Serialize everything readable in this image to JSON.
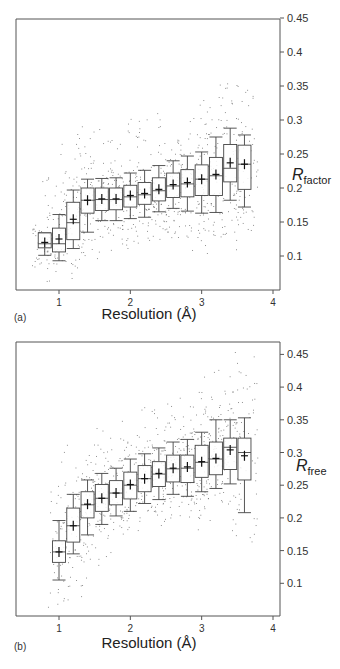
{
  "chart_data": [
    {
      "type": "box",
      "panel_label": "(a)",
      "title": "",
      "xlabel": "Resolution (Å)",
      "ylabel": "R",
      "ylabel_subscript": "factor",
      "xlim": [
        0.4,
        4.1
      ],
      "ylim": [
        0.05,
        0.455
      ],
      "xticks": [
        1,
        2,
        3,
        4
      ],
      "yticks": [
        0.1,
        0.15,
        0.2,
        0.25,
        0.3,
        0.35,
        0.4,
        0.45
      ],
      "ytick_labels": [
        "0.1",
        "0.15",
        "0.2",
        "0.25",
        "0.3",
        "0.35",
        "0.4",
        "0.45"
      ],
      "y_axis_position": "right",
      "grid": false,
      "boxes": [
        {
          "x": 0.8,
          "whisker_low": 0.101,
          "q1": 0.112,
          "median": 0.118,
          "q3": 0.134,
          "whisker_high": 0.134,
          "mean": 0.12
        },
        {
          "x": 1.0,
          "whisker_low": 0.093,
          "q1": 0.106,
          "median": 0.118,
          "q3": 0.141,
          "whisker_high": 0.161,
          "mean": 0.125
        },
        {
          "x": 1.2,
          "whisker_low": 0.111,
          "q1": 0.124,
          "median": 0.149,
          "q3": 0.179,
          "whisker_high": 0.197,
          "mean": 0.154
        },
        {
          "x": 1.4,
          "whisker_low": 0.135,
          "q1": 0.163,
          "median": 0.182,
          "q3": 0.2,
          "whisker_high": 0.213,
          "mean": 0.182
        },
        {
          "x": 1.6,
          "whisker_low": 0.152,
          "q1": 0.167,
          "median": 0.183,
          "q3": 0.2,
          "whisker_high": 0.214,
          "mean": 0.184
        },
        {
          "x": 1.8,
          "whisker_low": 0.152,
          "q1": 0.168,
          "median": 0.183,
          "q3": 0.2,
          "whisker_high": 0.215,
          "mean": 0.184
        },
        {
          "x": 2.0,
          "whisker_low": 0.155,
          "q1": 0.172,
          "median": 0.187,
          "q3": 0.204,
          "whisker_high": 0.222,
          "mean": 0.189
        },
        {
          "x": 2.2,
          "whisker_low": 0.157,
          "q1": 0.176,
          "median": 0.19,
          "q3": 0.208,
          "whisker_high": 0.226,
          "mean": 0.192
        },
        {
          "x": 2.4,
          "whisker_low": 0.165,
          "q1": 0.181,
          "median": 0.196,
          "q3": 0.215,
          "whisker_high": 0.233,
          "mean": 0.198
        },
        {
          "x": 2.6,
          "whisker_low": 0.17,
          "q1": 0.186,
          "median": 0.203,
          "q3": 0.222,
          "whisker_high": 0.24,
          "mean": 0.205
        },
        {
          "x": 2.8,
          "whisker_low": 0.166,
          "q1": 0.187,
          "median": 0.206,
          "q3": 0.227,
          "whisker_high": 0.247,
          "mean": 0.208
        },
        {
          "x": 3.0,
          "whisker_low": 0.163,
          "q1": 0.189,
          "median": 0.213,
          "q3": 0.234,
          "whisker_high": 0.253,
          "mean": 0.213
        },
        {
          "x": 3.2,
          "whisker_low": 0.164,
          "q1": 0.189,
          "median": 0.218,
          "q3": 0.245,
          "whisker_high": 0.275,
          "mean": 0.22
        },
        {
          "x": 3.4,
          "whisker_low": 0.182,
          "q1": 0.209,
          "median": 0.229,
          "q3": 0.264,
          "whisker_high": 0.288,
          "mean": 0.237
        },
        {
          "x": 3.6,
          "whisker_low": 0.172,
          "q1": 0.198,
          "median": 0.235,
          "q3": 0.263,
          "whisker_high": 0.278,
          "mean": 0.235
        }
      ],
      "outliers_description": "scattered individual points between ~0.06 and ~0.44"
    },
    {
      "type": "box",
      "panel_label": "(b)",
      "title": "",
      "xlabel": "Resolution (Å)",
      "ylabel": "R",
      "ylabel_subscript": "free",
      "xlim": [
        0.4,
        4.1
      ],
      "ylim": [
        0.05,
        0.47
      ],
      "xticks": [
        1,
        2,
        3,
        4
      ],
      "yticks": [
        0.1,
        0.15,
        0.2,
        0.25,
        0.3,
        0.35,
        0.4,
        0.45
      ],
      "ytick_labels": [
        "0.1",
        "0.15",
        "0.2",
        "0.25",
        "0.3",
        "0.35",
        "0.4",
        "0.45"
      ],
      "y_axis_position": "right",
      "grid": false,
      "boxes": [
        {
          "x": 1.0,
          "whisker_low": 0.105,
          "q1": 0.132,
          "median": 0.148,
          "q3": 0.165,
          "whisker_high": 0.196,
          "mean": 0.148
        },
        {
          "x": 1.2,
          "whisker_low": 0.145,
          "q1": 0.163,
          "median": 0.188,
          "q3": 0.215,
          "whisker_high": 0.236,
          "mean": 0.188
        },
        {
          "x": 1.4,
          "whisker_low": 0.174,
          "q1": 0.2,
          "median": 0.22,
          "q3": 0.24,
          "whisker_high": 0.258,
          "mean": 0.221
        },
        {
          "x": 1.6,
          "whisker_low": 0.19,
          "q1": 0.21,
          "median": 0.23,
          "q3": 0.251,
          "whisker_high": 0.268,
          "mean": 0.23
        },
        {
          "x": 1.8,
          "whisker_low": 0.203,
          "q1": 0.22,
          "median": 0.238,
          "q3": 0.257,
          "whisker_high": 0.276,
          "mean": 0.238
        },
        {
          "x": 2.0,
          "whisker_low": 0.21,
          "q1": 0.229,
          "median": 0.25,
          "q3": 0.27,
          "whisker_high": 0.29,
          "mean": 0.251
        },
        {
          "x": 2.2,
          "whisker_low": 0.222,
          "q1": 0.24,
          "median": 0.26,
          "q3": 0.28,
          "whisker_high": 0.298,
          "mean": 0.26
        },
        {
          "x": 2.4,
          "whisker_low": 0.228,
          "q1": 0.248,
          "median": 0.267,
          "q3": 0.286,
          "whisker_high": 0.307,
          "mean": 0.268
        },
        {
          "x": 2.6,
          "whisker_low": 0.236,
          "q1": 0.255,
          "median": 0.275,
          "q3": 0.296,
          "whisker_high": 0.316,
          "mean": 0.276
        },
        {
          "x": 2.8,
          "whisker_low": 0.233,
          "q1": 0.254,
          "median": 0.276,
          "q3": 0.296,
          "whisker_high": 0.32,
          "mean": 0.278
        },
        {
          "x": 3.0,
          "whisker_low": 0.24,
          "q1": 0.262,
          "median": 0.285,
          "q3": 0.311,
          "whisker_high": 0.331,
          "mean": 0.286
        },
        {
          "x": 3.2,
          "whisker_low": 0.245,
          "q1": 0.266,
          "median": 0.29,
          "q3": 0.316,
          "whisker_high": 0.35,
          "mean": 0.291
        },
        {
          "x": 3.4,
          "whisker_low": 0.252,
          "q1": 0.274,
          "median": 0.308,
          "q3": 0.322,
          "whisker_high": 0.35,
          "mean": 0.304
        },
        {
          "x": 3.6,
          "whisker_low": 0.208,
          "q1": 0.258,
          "median": 0.3,
          "q3": 0.322,
          "whisker_high": 0.353,
          "mean": 0.295
        }
      ],
      "outliers_description": "scattered individual points between ~0.07 and ~0.46"
    }
  ],
  "panels": {
    "a": {
      "label": "(a)",
      "xlabel": "Resolution (Å)",
      "ylabel_main": "R",
      "ylabel_sub": "factor"
    },
    "b": {
      "label": "(b)",
      "xlabel": "Resolution (Å)",
      "ylabel_main": "R",
      "ylabel_sub": "free"
    }
  }
}
